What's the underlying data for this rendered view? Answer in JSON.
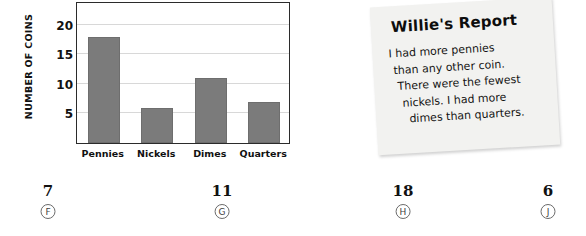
{
  "chart_data": {
    "type": "bar",
    "title": "",
    "xlabel": "",
    "ylabel": "NUMBER OF COINS",
    "categories": [
      "Pennies",
      "Nickels",
      "Dimes",
      "Quarters"
    ],
    "values": [
      18,
      6,
      11,
      7
    ],
    "ylim": [
      0,
      24
    ],
    "yticks": [
      5,
      10,
      15,
      20
    ],
    "ytick_labels": [
      "5",
      "10",
      "15",
      "20"
    ],
    "grid": true,
    "legend": false,
    "bar_color": "#7b7b7b",
    "frame_color": "#2b2b2b",
    "gridline_color": "#d8d8d8"
  },
  "report": {
    "title": "Willie's Report",
    "lines": [
      "I had more pennies",
      "than any other coin.",
      "There were the fewest",
      "nickels. I had more",
      "dimes than quarters."
    ],
    "paper_color": "#f2f2f0"
  },
  "answers": [
    {
      "value": "7",
      "letter": "F"
    },
    {
      "value": "11",
      "letter": "G"
    },
    {
      "value": "18",
      "letter": "H"
    },
    {
      "value": "6",
      "letter": "J"
    }
  ]
}
